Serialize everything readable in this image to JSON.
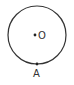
{
  "diagram": {
    "type": "geometry",
    "circle": {
      "cx": 37,
      "cy": 35,
      "r": 29,
      "stroke": "#333333"
    },
    "points": [
      {
        "name": "O",
        "label": "O",
        "x": 37,
        "y": 35,
        "label_position": "right"
      },
      {
        "name": "A",
        "label": "A",
        "x": 37,
        "y": 64,
        "label_position": "below"
      }
    ]
  }
}
